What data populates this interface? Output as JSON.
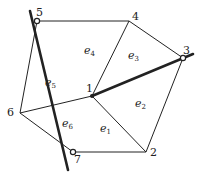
{
  "diagram": {
    "type": "finite-element-mesh",
    "nodes": [
      {
        "id": "1",
        "label": "1",
        "x": 92,
        "y": 96,
        "lx": 86,
        "ly": 92
      },
      {
        "id": "2",
        "label": "2",
        "x": 146,
        "y": 152,
        "lx": 150,
        "ly": 156
      },
      {
        "id": "3",
        "label": "3",
        "x": 183,
        "y": 58,
        "lx": 183,
        "ly": 54
      },
      {
        "id": "4",
        "label": "4",
        "x": 129,
        "y": 21,
        "lx": 132,
        "ly": 20
      },
      {
        "id": "5",
        "label": "5",
        "x": 37,
        "y": 21,
        "lx": 36,
        "ly": 16
      },
      {
        "id": "6",
        "label": "6",
        "x": 20,
        "y": 113,
        "lx": 7,
        "ly": 116
      },
      {
        "id": "7",
        "label": "7",
        "x": 73,
        "y": 152,
        "lx": 74,
        "ly": 163
      }
    ],
    "elements": [
      {
        "id": "e1",
        "base": "e",
        "sub": "1",
        "x": 100,
        "y": 132
      },
      {
        "id": "e2",
        "base": "e",
        "sub": "2",
        "x": 135,
        "y": 107
      },
      {
        "id": "e3",
        "base": "e",
        "sub": "3",
        "x": 128,
        "y": 59
      },
      {
        "id": "e4",
        "base": "e",
        "sub": "4",
        "x": 84,
        "y": 54
      },
      {
        "id": "e5",
        "base": "e",
        "sub": "5",
        "x": 45,
        "y": 86
      },
      {
        "id": "e6",
        "base": "e",
        "sub": "6",
        "x": 62,
        "y": 127
      }
    ],
    "thin_edges": [
      [
        "5",
        "4"
      ],
      [
        "4",
        "3"
      ],
      [
        "3",
        "2"
      ],
      [
        "2",
        "7"
      ],
      [
        "7",
        "6"
      ],
      [
        "6",
        "5"
      ],
      [
        "1",
        "4"
      ],
      [
        "1",
        "2"
      ],
      [
        "1",
        "6"
      ]
    ],
    "thick_lines": [
      {
        "x1": 30,
        "y1": 11,
        "x2": 68,
        "y2": 170
      },
      {
        "x1": 92,
        "y1": 96,
        "x2": 193,
        "y2": 54
      }
    ],
    "marked_nodes": [
      "3",
      "5",
      "7"
    ],
    "colors": {
      "line": "#222222",
      "background": "#ffffff"
    }
  }
}
